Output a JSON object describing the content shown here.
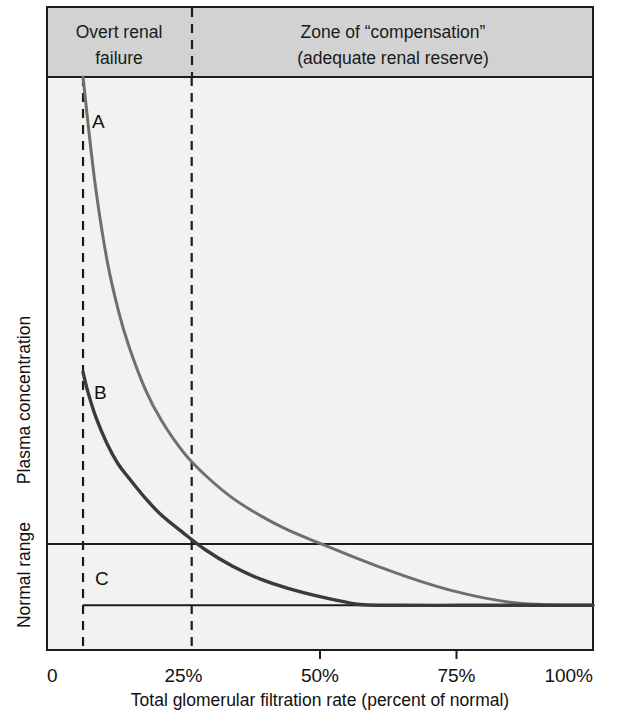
{
  "figure": {
    "title_in_image": "",
    "background_color": "#f2f2f0",
    "banner_color": "#d2d2d2",
    "line_color": "#1c1c1c"
  },
  "banner": {
    "left_zone_line1": "Overt renal",
    "left_zone_line2": "failure",
    "right_zone_line1": "Zone of “compensation”",
    "right_zone_line2": "(adequate renal reserve)",
    "divider_at_percent": 25
  },
  "labels": {
    "y_axis_title": "Plasma concentration",
    "normal_range": "Normal range",
    "x_axis_title": "Total glomerular filtration rate (percent of normal)",
    "curve_a": "A",
    "curve_b": "B",
    "curve_c": "C"
  },
  "chart_data": {
    "type": "line",
    "title": "",
    "subtitle": "",
    "xlabel": "Total glomerular filtration rate (percent of normal)",
    "ylabel": "Plasma concentration",
    "xlim": [
      0,
      100
    ],
    "ylim": [
      0,
      100
    ],
    "grid": false,
    "legend_position": "inline-curve-labels",
    "x_ticks": [
      0,
      25,
      50,
      75,
      100
    ],
    "x_tick_labels": [
      "0",
      "25%",
      "50%",
      "75%",
      "100%"
    ],
    "y_ticks": [],
    "y_tick_labels": [],
    "annotations": [
      {
        "text": "Overt renal failure",
        "x_range": [
          0,
          25
        ],
        "position": "banner-left"
      },
      {
        "text": "Zone of “compensation” (adequate renal reserve)",
        "x_range": [
          25,
          100
        ],
        "position": "banner-right"
      },
      {
        "text": "A",
        "x": 9,
        "y": 93,
        "note": "label for curve A"
      },
      {
        "text": "B",
        "x": 10,
        "y": 48,
        "note": "label for curve B"
      },
      {
        "text": "C",
        "x": 8,
        "y": 12,
        "note": "label for band C / below normal range"
      },
      {
        "text": "Normal range",
        "position": "y-axis-band",
        "note": "band between the two horizontal lines"
      }
    ],
    "reference_lines": [
      {
        "name": "normal-range-upper",
        "orientation": "horizontal",
        "y": 18.5,
        "x_from": 0,
        "x_to": 100
      },
      {
        "name": "normal-range-lower",
        "orientation": "horizontal",
        "y": 7.8,
        "x_from": 6.6,
        "x_to": 100
      },
      {
        "name": "renal-failure-boundary",
        "orientation": "vertical",
        "x": 6.6,
        "style": "dashed"
      },
      {
        "name": "compensation-boundary",
        "orientation": "vertical",
        "x": 26.5,
        "style": "dashed"
      }
    ],
    "series": [
      {
        "name": "A",
        "color": "#6f6f6f",
        "width": 3.0,
        "description": "Substance A – plasma concentration rises steeply as GFR falls; crosses upper normal-range line near 50% GFR and reaches the normal floor near 82% GFR.",
        "x": [
          6.6,
          7.5,
          9,
          11,
          13,
          15,
          18,
          21,
          25,
          29,
          34,
          39,
          44,
          50,
          56,
          62,
          68,
          74,
          80,
          86,
          92,
          100
        ],
        "y": [
          100,
          92,
          80,
          68,
          59.5,
          53,
          45.5,
          40,
          34.5,
          30.5,
          26.5,
          23.5,
          21,
          18.6,
          16.3,
          14.1,
          12.1,
          10.4,
          9.1,
          8.2,
          7.9,
          7.8
        ]
      },
      {
        "name": "B",
        "color": "#3a3a3a",
        "width": 3.4,
        "description": "Substance B – lower curve; crosses upper normal-range line at 25% GFR and flattens onto the normal floor near 58% GFR.",
        "x": [
          6.6,
          7.5,
          9,
          11,
          13,
          15,
          18,
          21,
          25,
          29,
          34,
          39,
          44,
          50,
          55,
          58,
          65,
          75,
          85,
          100
        ],
        "y": [
          48.5,
          45,
          40.5,
          36,
          32.5,
          30,
          26.5,
          23.5,
          20.4,
          17.5,
          14.6,
          12.4,
          10.8,
          9.3,
          8.3,
          7.9,
          7.8,
          7.8,
          7.8,
          7.8
        ]
      }
    ]
  }
}
